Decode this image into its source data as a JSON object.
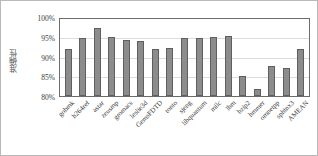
{
  "chart_data": {
    "type": "bar",
    "title": "",
    "xlabel": "",
    "ylabel": "准确性",
    "ylim": [
      80,
      100
    ],
    "yticks": [
      "100%",
      "95%",
      "90%",
      "85%",
      "80%"
    ],
    "ytick_values": [
      100,
      95,
      90,
      85,
      80
    ],
    "grid": true,
    "legend": "none",
    "unit": "percent",
    "categories": [
      "gobmk",
      "h264ref",
      "astar",
      "zeusmp",
      "gromacs",
      "leslie3d",
      "GemsFDTD",
      "tonto",
      "sjeng",
      "libquantum",
      "milc",
      "lbm",
      "bzip2",
      "hmmer",
      "omnetpp",
      "sphinx3",
      "AMEAN"
    ],
    "values": [
      92.3,
      95.1,
      97.6,
      95.4,
      94.5,
      94.2,
      92.3,
      92.6,
      95.0,
      95.1,
      95.2,
      95.6,
      85.3,
      81.9,
      87.8,
      87.3,
      92.3
    ]
  }
}
